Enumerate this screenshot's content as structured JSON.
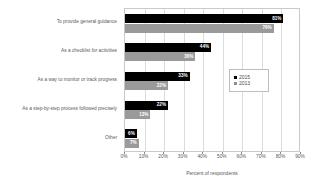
{
  "chart_data": {
    "type": "bar",
    "orientation": "horizontal",
    "title": "",
    "xlabel": "Percent of respondents",
    "ylabel": "",
    "xlim": [
      0,
      90
    ],
    "xtick_step": 10,
    "xticks": [
      "0%",
      "10%",
      "20%",
      "30%",
      "40%",
      "50%",
      "60%",
      "70%",
      "80%",
      "90%"
    ],
    "grid": true,
    "legend_position": "center-right",
    "categories": [
      "To provide general guidance",
      "As a checklist for activities",
      "As a way to monitor or track progress",
      "As a step-by-step process followed precisely",
      "Other"
    ],
    "series": [
      {
        "name": "2015",
        "color": "#000000",
        "values": [
          81,
          44,
          33,
          22,
          6
        ],
        "labels": [
          "81%",
          "44%",
          "33%",
          "22%",
          "6%"
        ]
      },
      {
        "name": "2013",
        "color": "#9a9a9a",
        "values": [
          76,
          36,
          22,
          13,
          7
        ],
        "labels": [
          "76%",
          "36%",
          "22%",
          "13%",
          "7%"
        ]
      }
    ]
  },
  "legend": {
    "items": [
      {
        "label": "2015",
        "color": "#000000"
      },
      {
        "label": "2013",
        "color": "#8f8f8f"
      }
    ]
  }
}
